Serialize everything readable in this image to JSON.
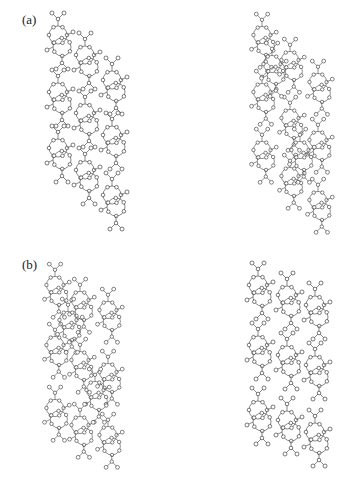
{
  "figure": {
    "panels": [
      {
        "id": "a",
        "label": "(a)",
        "views": [
          {
            "name": "left-view",
            "description": "crystal packing, three offset stacked columns of molecules"
          },
          {
            "name": "right-view",
            "description": "crystal packing, interlocked network of molecules"
          }
        ]
      },
      {
        "id": "b",
        "label": "(b)",
        "views": [
          {
            "name": "left-view",
            "description": "crystal packing, dense interlocked network"
          },
          {
            "name": "right-view",
            "description": "crystal packing, three parallel columns of molecules"
          }
        ]
      }
    ],
    "colors": {
      "line": "#555555",
      "atom_fill": "#ffffff",
      "background": "#ffffff"
    }
  }
}
